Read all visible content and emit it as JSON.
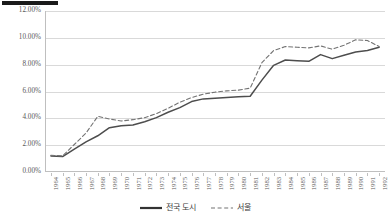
{
  "decoration": {
    "top_rule": "black-rule"
  },
  "chart_data": {
    "type": "line",
    "title": "",
    "xlabel": "",
    "ylabel": "",
    "ylim": [
      0,
      12
    ],
    "ytick_labels": [
      "12.00%",
      "10.00%",
      "8.00%",
      "6.00%",
      "4.00%",
      "2.00%",
      "0.00%"
    ],
    "ytick_values": [
      12,
      10,
      8,
      6,
      4,
      2,
      0
    ],
    "grid": true,
    "legend_position": "bottom",
    "categories": [
      "1964",
      "1965",
      "1966",
      "1967",
      "1968",
      "1969",
      "1970",
      "1971",
      "1972",
      "1973",
      "1974",
      "1975",
      "1976",
      "1977",
      "1978",
      "1979",
      "1980",
      "1981",
      "1982",
      "1983",
      "1984",
      "1985",
      "1986",
      "1987",
      "1988",
      "1989",
      "1990",
      "1991",
      "1992"
    ],
    "series": [
      {
        "name": "전국 도시",
        "style": "solid",
        "color": "#4d4d4d",
        "values": [
          1.2,
          1.15,
          1.7,
          2.25,
          2.7,
          3.3,
          3.45,
          3.5,
          3.75,
          4.05,
          4.45,
          4.8,
          5.25,
          5.45,
          5.5,
          5.55,
          5.6,
          5.65,
          6.85,
          7.95,
          8.35,
          8.3,
          8.25,
          8.75,
          8.45,
          8.7,
          8.95,
          9.05,
          9.3
        ]
      },
      {
        "name": "서울",
        "style": "dashed",
        "color": "#737373",
        "values": [
          1.25,
          1.2,
          2.05,
          2.9,
          4.15,
          3.95,
          3.8,
          3.9,
          4.05,
          4.35,
          4.75,
          5.2,
          5.55,
          5.8,
          5.95,
          6.05,
          6.1,
          6.25,
          8.15,
          9.05,
          9.35,
          9.3,
          9.25,
          9.4,
          9.15,
          9.45,
          9.85,
          9.8,
          9.35
        ]
      }
    ]
  }
}
